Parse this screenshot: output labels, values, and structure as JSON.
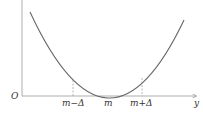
{
  "diagram": {
    "type": "parabola-minimum",
    "origin_label": "O",
    "x_axis_label": "y",
    "ticks": [
      {
        "id": "left",
        "label": "m−Δ"
      },
      {
        "id": "center",
        "label": "m"
      },
      {
        "id": "right",
        "label": "m+Δ"
      }
    ],
    "colors": {
      "curve": "#666666",
      "axis": "#888888",
      "dashed": "#999999",
      "text": "#333333"
    }
  }
}
